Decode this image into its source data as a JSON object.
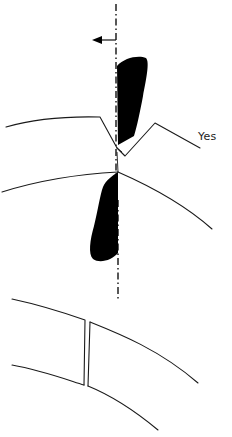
{
  "diagram": {
    "labels": {
      "yes": "Yes"
    },
    "colors": {
      "background": "#ffffff",
      "line": "#1a1a1a",
      "fill": "#000000"
    },
    "elements": [
      "center-axis-dash-dot",
      "direction-arrow-left",
      "upper-black-blade",
      "lower-black-blade",
      "upper-curved-band",
      "lower-curved-band",
      "bottom-band-with-gap"
    ]
  }
}
